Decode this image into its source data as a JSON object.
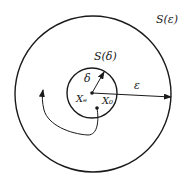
{
  "diagram": {
    "outer_circle": {
      "label": "S(ε)",
      "cx": 93,
      "cy": 94,
      "r": 78
    },
    "inner_circle": {
      "label": "S(δ)",
      "cx": 92,
      "cy": 93,
      "r": 25
    },
    "radius_inner_label": "δ",
    "radius_outer_label": "ε",
    "equilibrium_point_label": "Xₑ",
    "initial_point_label": "X₀",
    "stroke_color": "#1a1a1a",
    "background_color": "#ffffff"
  }
}
